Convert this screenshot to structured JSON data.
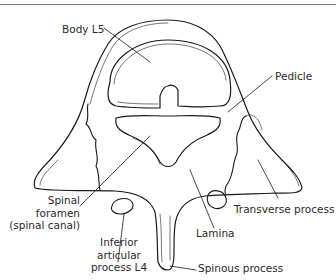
{
  "figure": {
    "line_color": "#1a1a1a",
    "label_color": "#2a2a2a",
    "rule_color": "#7a7a7a"
  },
  "labels": {
    "body": "Body L5",
    "pedicle": "Pedicle",
    "spinal_foramen_1": "Spinal",
    "spinal_foramen_2": "foramen",
    "spinal_foramen_3": "(spinal canal)",
    "transverse_process": "Transverse process",
    "lamina": "Lamina",
    "inferior_articular_1": "Inferior",
    "inferior_articular_2": "articular",
    "inferior_articular_3": "process L4",
    "spinous_process": "Spinous process"
  }
}
